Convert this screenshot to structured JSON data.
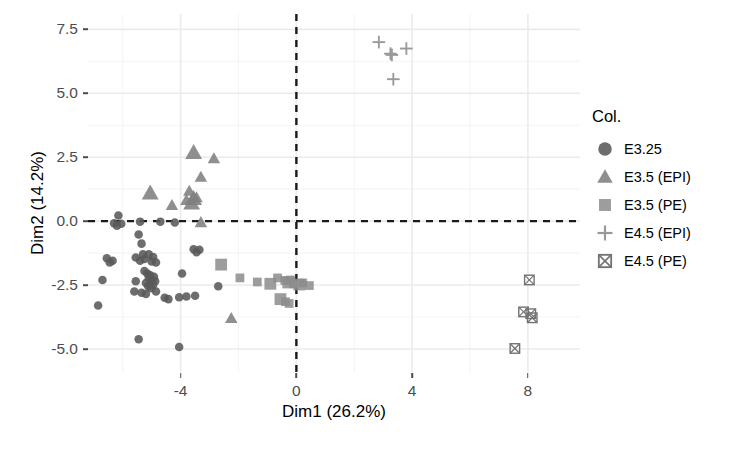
{
  "axes": {
    "xlabel": "Dim1 (26.2%)",
    "ylabel": "Dim2 (14.2%)",
    "xticks": [
      "-4",
      "0",
      "4",
      "8"
    ],
    "yticks": [
      "7.5",
      "5.0",
      "2.5",
      "0.0",
      "-2.5",
      "-5.0"
    ]
  },
  "legend": {
    "title": "Col.",
    "items": [
      {
        "label": "E3.25",
        "marker": "circle"
      },
      {
        "label": "E3.5 (EPI)",
        "marker": "triangle"
      },
      {
        "label": "E3.5 (PE)",
        "marker": "square"
      },
      {
        "label": "E4.5 (EPI)",
        "marker": "plus"
      },
      {
        "label": "E4.5 (PE)",
        "marker": "square-x"
      }
    ]
  },
  "colors": {
    "circle": "#595959",
    "triangle": "#808080",
    "square": "#8c8c8c",
    "plus": "#999999",
    "square_x": "#737373",
    "grid_major": "#ebebeb",
    "grid_minor": "#f5f5f5",
    "reference_line": "#1a1a1a",
    "axis_text": "#4d4d4d"
  },
  "chart_data": {
    "type": "scatter",
    "title": "",
    "xlabel": "Dim1 (26.2%)",
    "ylabel": "Dim2 (14.2%)",
    "xlim": [
      -7.2,
      9.8
    ],
    "ylim": [
      -5.9,
      8.1
    ],
    "xticks": [
      -4,
      0,
      4,
      8
    ],
    "yticks": [
      -5.0,
      -2.5,
      0.0,
      2.5,
      5.0,
      7.5
    ],
    "grid": true,
    "legend_position": "right",
    "legend_title": "Col.",
    "reference_lines": [
      {
        "axis": "x",
        "value": 0,
        "style": "dashed",
        "color": "#1a1a1a"
      },
      {
        "axis": "y",
        "value": 0,
        "style": "dashed",
        "color": "#1a1a1a"
      }
    ],
    "series": [
      {
        "name": "E3.25",
        "marker": "circle",
        "color": "#595959",
        "points": [
          [
            -6.15,
            0.22
          ],
          [
            -6.3,
            -0.08
          ],
          [
            -6.2,
            -0.18
          ],
          [
            -6.05,
            -0.1
          ],
          [
            -5.4,
            -0.02
          ],
          [
            -5.45,
            -0.52
          ],
          [
            -5.35,
            -0.88
          ],
          [
            -5.3,
            -1.3
          ],
          [
            -4.7,
            -0.02
          ],
          [
            -4.2,
            -0.05
          ],
          [
            -6.55,
            -1.45
          ],
          [
            -6.35,
            -1.55
          ],
          [
            -6.45,
            -1.62
          ],
          [
            -5.55,
            -1.42
          ],
          [
            -5.4,
            -1.55
          ],
          [
            -5.25,
            -1.48
          ],
          [
            -5.1,
            -1.3
          ],
          [
            -4.95,
            -1.4
          ],
          [
            -5.0,
            -1.58
          ],
          [
            -4.85,
            -1.62
          ],
          [
            -3.55,
            -1.1
          ],
          [
            -3.35,
            -1.12
          ],
          [
            -3.45,
            -1.22
          ],
          [
            -5.25,
            -1.95
          ],
          [
            -5.15,
            -2.05
          ],
          [
            -5.05,
            -2.12
          ],
          [
            -5.1,
            -2.22
          ],
          [
            -5.0,
            -2.3
          ],
          [
            -4.92,
            -2.18
          ],
          [
            -4.88,
            -2.35
          ],
          [
            -5.2,
            -2.42
          ],
          [
            -5.12,
            -2.55
          ],
          [
            -5.02,
            -2.62
          ],
          [
            -4.95,
            -2.5
          ],
          [
            -3.95,
            -2.05
          ],
          [
            -6.7,
            -2.3
          ],
          [
            -5.55,
            -2.35
          ],
          [
            -5.6,
            -2.75
          ],
          [
            -5.35,
            -2.8
          ],
          [
            -5.2,
            -2.85
          ],
          [
            -4.85,
            -2.75
          ],
          [
            -4.55,
            -3.0
          ],
          [
            -4.42,
            -3.05
          ],
          [
            -4.05,
            -2.98
          ],
          [
            -3.8,
            -2.95
          ],
          [
            -3.5,
            -2.92
          ],
          [
            -2.7,
            -2.55
          ],
          [
            -6.85,
            -3.3
          ],
          [
            -5.45,
            -4.62
          ],
          [
            -4.05,
            -4.92
          ]
        ]
      },
      {
        "name": "E3.5 (EPI)",
        "marker": "triangle",
        "color": "#808080",
        "points": [
          [
            -3.55,
            2.68
          ],
          [
            -2.85,
            2.45
          ],
          [
            -3.3,
            1.72
          ],
          [
            -5.05,
            1.1
          ],
          [
            -3.7,
            1.18
          ],
          [
            -3.45,
            0.92
          ],
          [
            -3.55,
            0.88
          ],
          [
            -4.3,
            0.62
          ],
          [
            -3.8,
            0.82
          ],
          [
            -3.62,
            0.7
          ],
          [
            -3.3,
            -0.05
          ],
          [
            -2.25,
            -3.8
          ]
        ]
      },
      {
        "name": "E3.5 (PE)",
        "marker": "square",
        "color": "#8c8c8c",
        "points": [
          [
            -2.6,
            -1.7
          ],
          [
            -1.95,
            -2.22
          ],
          [
            -1.35,
            -2.38
          ],
          [
            -0.9,
            -2.45
          ],
          [
            -0.65,
            -2.22
          ],
          [
            -0.4,
            -2.32
          ],
          [
            -0.28,
            -2.4
          ],
          [
            -0.2,
            -2.3
          ],
          [
            -0.1,
            -2.45
          ],
          [
            0.1,
            -2.48
          ],
          [
            0.22,
            -2.42
          ],
          [
            0.45,
            -2.52
          ],
          [
            -0.55,
            -3.05
          ],
          [
            -0.38,
            -3.15
          ],
          [
            -0.25,
            -3.22
          ]
        ]
      },
      {
        "name": "E4.5 (EPI)",
        "marker": "plus",
        "color": "#999999",
        "points": [
          [
            2.85,
            7.0
          ],
          [
            3.8,
            6.75
          ],
          [
            3.25,
            6.55
          ],
          [
            3.3,
            6.5
          ],
          [
            3.35,
            5.55
          ]
        ]
      },
      {
        "name": "E4.5 (PE)",
        "marker": "square-x",
        "color": "#737373",
        "points": [
          [
            8.05,
            -2.3
          ],
          [
            7.85,
            -3.55
          ],
          [
            8.1,
            -3.62
          ],
          [
            8.15,
            -3.78
          ],
          [
            7.55,
            -4.98
          ]
        ]
      }
    ]
  }
}
